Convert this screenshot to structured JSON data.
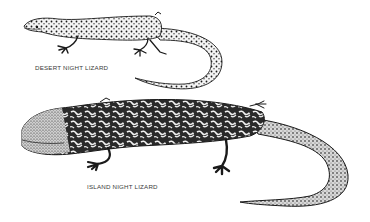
{
  "figure": {
    "background": "#ffffff",
    "ink_color": "#1a1a1a",
    "specimens": [
      {
        "id": "desert",
        "label": "DESERT NIGHT LIZARD",
        "pattern": "spotted"
      },
      {
        "id": "island",
        "label": "ISLAND NIGHT LIZARD",
        "pattern": "marbled"
      }
    ]
  }
}
